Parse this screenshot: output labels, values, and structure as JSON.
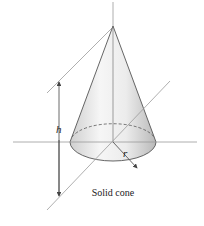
{
  "figure": {
    "caption": "Solid cone",
    "labels": {
      "height": "h",
      "radius": "r"
    },
    "colors": {
      "line": "#555555",
      "axis": "#9a9a9a",
      "cone_light": "#f4f4f4",
      "cone_dark": "#bdbdbd"
    }
  }
}
